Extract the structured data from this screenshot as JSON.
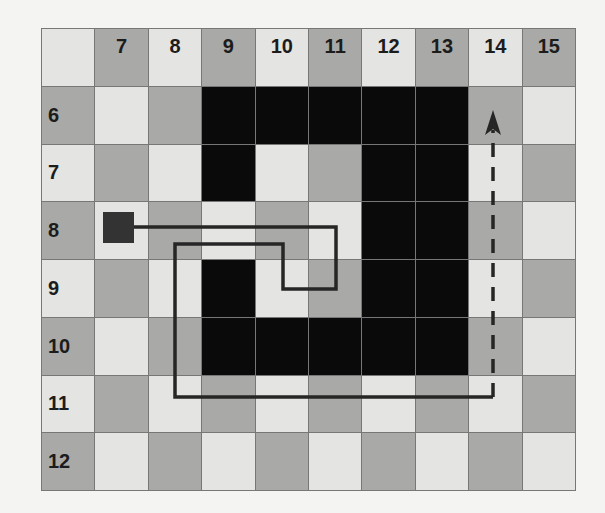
{
  "grid": {
    "columns": [
      "",
      "7",
      "8",
      "9",
      "10",
      "11",
      "12",
      "13",
      "14",
      "15"
    ],
    "rows": [
      "",
      "6",
      "7",
      "8",
      "9",
      "10",
      "11",
      "12"
    ],
    "colors": {
      "light": "#e4e4e2",
      "dark": "#a9a9a7",
      "wall": "#0a0a0a",
      "line": "#777777"
    },
    "walls": [
      {
        "row": "6",
        "col": "9"
      },
      {
        "row": "6",
        "col": "10"
      },
      {
        "row": "6",
        "col": "11"
      },
      {
        "row": "6",
        "col": "12"
      },
      {
        "row": "6",
        "col": "13"
      },
      {
        "row": "7",
        "col": "9"
      },
      {
        "row": "7",
        "col": "12"
      },
      {
        "row": "7",
        "col": "13"
      },
      {
        "row": "8",
        "col": "12"
      },
      {
        "row": "8",
        "col": "13"
      },
      {
        "row": "9",
        "col": "9"
      },
      {
        "row": "9",
        "col": "12"
      },
      {
        "row": "9",
        "col": "13"
      },
      {
        "row": "10",
        "col": "9"
      },
      {
        "row": "10",
        "col": "10"
      },
      {
        "row": "10",
        "col": "11"
      },
      {
        "row": "10",
        "col": "12"
      },
      {
        "row": "10",
        "col": "13"
      }
    ]
  },
  "start_marker": {
    "row": "8",
    "col": "7",
    "color": "#333333"
  },
  "path": {
    "solid_points": [
      [
        134,
        227
      ],
      [
        336,
        227
      ],
      [
        336,
        289
      ],
      [
        283,
        289
      ],
      [
        283,
        244
      ],
      [
        175,
        244
      ],
      [
        175,
        397
      ],
      [
        493,
        397
      ]
    ],
    "dashed_points": [
      [
        493,
        397
      ],
      [
        493,
        130
      ]
    ],
    "arrow_tip": [
      493,
      110
    ],
    "color": "#262626"
  }
}
